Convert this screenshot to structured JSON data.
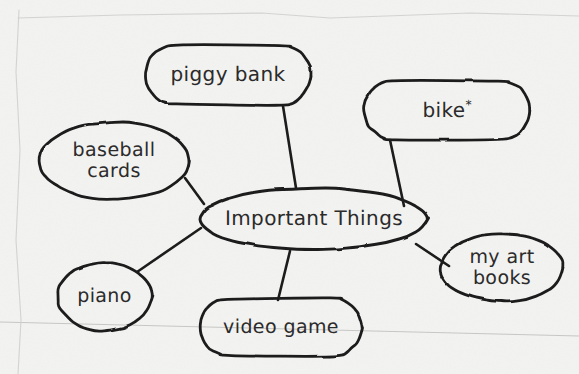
{
  "document": {
    "kind": "hand-drawn mind map on lined paper",
    "background_color": "#f3f3f1",
    "ink_color": "#1c1c1c",
    "rule_line_color": "#b9b9b9"
  },
  "map": {
    "center": {
      "id": "important-things",
      "label": "Important Things",
      "x": 200,
      "y": 188,
      "w": 228,
      "h": 62,
      "font_size": 20,
      "shape": "blob-oval"
    },
    "nodes": [
      {
        "id": "piggy-bank",
        "label": "piggy bank",
        "x": 145,
        "y": 45,
        "w": 166,
        "h": 60,
        "font_size": 20,
        "shape": "blob-pill",
        "lines": [
          "piggy bank"
        ]
      },
      {
        "id": "bike",
        "label": "bike",
        "superscript": "*",
        "x": 364,
        "y": 80,
        "w": 166,
        "h": 60,
        "font_size": 20,
        "shape": "blob-pill",
        "lines": [
          "bike"
        ]
      },
      {
        "id": "baseball-cards",
        "label": "baseball cards",
        "x": 38,
        "y": 122,
        "w": 152,
        "h": 78,
        "font_size": 19,
        "shape": "blob-round",
        "lines": [
          "baseball",
          "cards"
        ]
      },
      {
        "id": "my-art-books",
        "label": "my art books",
        "x": 440,
        "y": 234,
        "w": 124,
        "h": 68,
        "font_size": 19,
        "shape": "blob-round",
        "lines": [
          "my art",
          "books"
        ]
      },
      {
        "id": "piano",
        "label": "piano",
        "x": 57,
        "y": 262,
        "w": 95,
        "h": 69,
        "font_size": 19,
        "shape": "blob-round",
        "lines": [
          "piano"
        ]
      },
      {
        "id": "video-game",
        "label": "video game",
        "x": 200,
        "y": 298,
        "w": 162,
        "h": 58,
        "font_size": 19,
        "shape": "blob-pill",
        "lines": [
          "video game"
        ]
      }
    ],
    "edges": [
      {
        "id": "edge-center-piggy-bank",
        "from": "important-things",
        "to": "piggy-bank",
        "path": "M 296 188 L 283 106"
      },
      {
        "id": "edge-center-bike",
        "from": "important-things",
        "to": "bike",
        "path": "M 404 206 L 390 140"
      },
      {
        "id": "edge-center-baseball",
        "from": "important-things",
        "to": "baseball-cards",
        "path": "M 204 204 L 185 178"
      },
      {
        "id": "edge-center-my-art-books",
        "from": "important-things",
        "to": "my-art-books",
        "path": "M 416 244 L 449 266"
      },
      {
        "id": "edge-center-piano",
        "from": "important-things",
        "to": "piano",
        "path": "M 201 228 L 137 272"
      },
      {
        "id": "edge-center-video-game",
        "from": "important-things",
        "to": "video-game",
        "path": "M 290 251 L 278 300"
      }
    ],
    "rule_lines": [
      {
        "id": "rule-line-1",
        "x1": 0,
        "y1": 322,
        "x2": 579,
        "y2": 336
      }
    ],
    "paper_edges": [
      {
        "id": "paper-edge-top",
        "path": "M 18 18 L 120 15 L 262 13 L 330 18 L 470 13 L 579 16"
      },
      {
        "id": "paper-edge-left",
        "path": "M 19 10 L 16 72 L 20 150 L 16 240 L 21 320 L 18 374"
      }
    ]
  }
}
